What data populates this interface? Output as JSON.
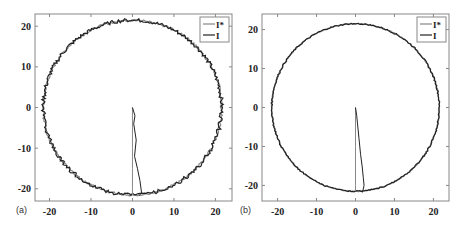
{
  "chart_data": [
    {
      "type": "line",
      "panel_label": "(a)",
      "title": "",
      "xlabel": "",
      "ylabel": "",
      "xlim": [
        -23.5,
        24
      ],
      "ylim": [
        -23,
        23
      ],
      "xticks": [
        -20,
        -10,
        0,
        10,
        20
      ],
      "yticks": [
        -20,
        -10,
        0,
        10,
        20
      ],
      "xtick_labels": [
        "-20",
        "-10",
        "0",
        "10",
        "20"
      ],
      "ytick_labels": [
        "-20",
        "-10",
        "0",
        "10",
        "20"
      ],
      "grid": false,
      "legend_position": "top-right",
      "circle_radius": 21.5,
      "noise_level": "high",
      "series": [
        {
          "name": "I*",
          "color": "#888888",
          "x": [
            0,
            0,
            0,
            0,
            0,
            0
          ],
          "y": [
            0,
            -5,
            -10,
            -15,
            -20,
            -21.5
          ]
        },
        {
          "name": "I",
          "color": "#222222",
          "x": [
            0,
            0.6,
            0.3,
            0.9,
            0.5,
            1.2,
            1.8,
            2.2,
            1.5
          ],
          "y": [
            0,
            -2,
            -4,
            -8,
            -12,
            -15,
            -18,
            -21,
            -21.8
          ]
        }
      ]
    },
    {
      "type": "line",
      "panel_label": "(b)",
      "title": "",
      "xlabel": "",
      "ylabel": "",
      "xlim": [
        -24,
        24
      ],
      "ylim": [
        -24,
        24
      ],
      "xticks": [
        -20,
        -10,
        0,
        10,
        20
      ],
      "yticks": [
        -20,
        -10,
        0,
        10,
        20
      ],
      "xtick_labels": [
        "-20",
        "-10",
        "0",
        "10",
        "20"
      ],
      "ytick_labels": [
        "-20",
        "-10",
        "0",
        "10",
        "20"
      ],
      "grid": false,
      "legend_position": "top-right",
      "circle_radius": 21.5,
      "noise_level": "low",
      "series": [
        {
          "name": "I*",
          "color": "#888888",
          "x": [
            0,
            0,
            0,
            0,
            0,
            0
          ],
          "y": [
            0,
            -5,
            -10,
            -15,
            -20,
            -21.5
          ]
        },
        {
          "name": "I",
          "color": "#222222",
          "x": [
            0,
            0.3,
            0.5,
            0.9,
            1.3,
            1.7,
            2.0,
            2.2,
            1.8
          ],
          "y": [
            0,
            -2,
            -4,
            -8,
            -12,
            -15,
            -18,
            -20,
            -21.8
          ]
        }
      ]
    }
  ]
}
